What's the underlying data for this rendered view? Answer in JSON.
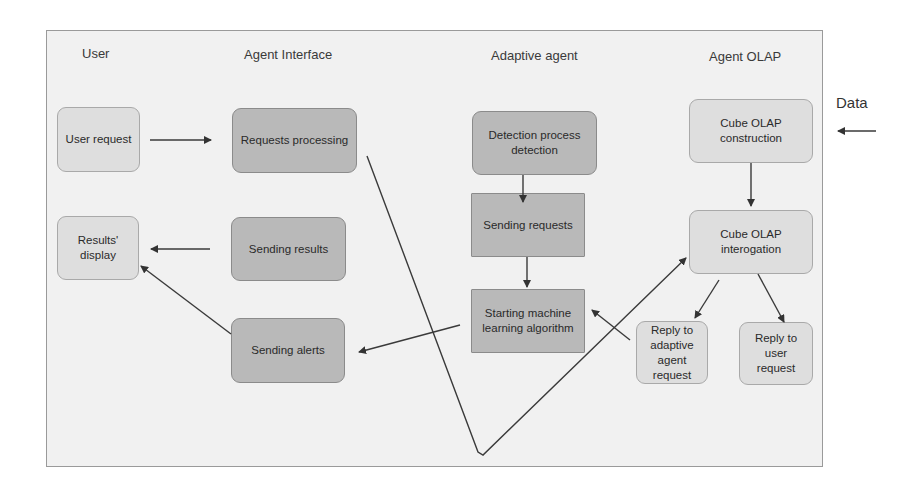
{
  "lanes": [
    {
      "id": "user",
      "title": "User"
    },
    {
      "id": "agent_interface",
      "title": "Agent Interface"
    },
    {
      "id": "adaptive_agent",
      "title": "Adaptive agent"
    },
    {
      "id": "agent_olap",
      "title": "Agent OLAP"
    }
  ],
  "nodes": {
    "user_request": "User request",
    "results_display": "Results' display",
    "requests_processing": "Requests processing",
    "sending_results": "Sending results",
    "sending_alerts": "Sending alerts",
    "detection_process": "Detection process detection",
    "sending_requests": "Sending requests",
    "starting_ml": "Starting machine learning algorithm",
    "cube_construction": "Cube OLAP construction",
    "cube_interogation": "Cube OLAP interogation",
    "reply_adaptive": "Reply to adaptive agent request",
    "reply_user": "Reply to user request"
  },
  "external": {
    "data_label": "Data"
  },
  "edges": [
    {
      "from": "user_request",
      "to": "requests_processing"
    },
    {
      "from": "sending_results",
      "to": "results_display"
    },
    {
      "from": "sending_alerts",
      "to": "results_display"
    },
    {
      "from": "detection_process",
      "to": "sending_requests"
    },
    {
      "from": "sending_requests",
      "to": "starting_ml"
    },
    {
      "from": "starting_ml",
      "to": "sending_alerts"
    },
    {
      "from": "requests_processing",
      "to": "cube_interogation"
    },
    {
      "from": "data",
      "to": "cube_construction"
    },
    {
      "from": "cube_construction",
      "to": "cube_interogation"
    },
    {
      "from": "cube_interogation",
      "to": "reply_adaptive"
    },
    {
      "from": "cube_interogation",
      "to": "reply_user"
    },
    {
      "from": "reply_adaptive",
      "to": "starting_ml"
    }
  ],
  "colors": {
    "frame_bg": "#f1f1f1",
    "light_box": "#dedede",
    "dark_box": "#b9b9b9",
    "line": "#3a3a3a"
  }
}
